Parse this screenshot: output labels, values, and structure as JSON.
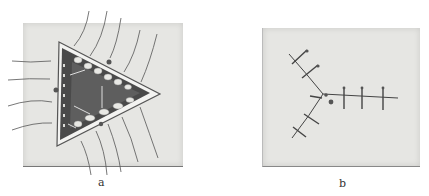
{
  "figure": {
    "panels": [
      {
        "id": "a",
        "label": "a",
        "description": "Triangular wound with undermined edges and placed suture threads"
      },
      {
        "id": "b",
        "label": "b",
        "description": "Closed wound in Y-shaped suture line with interrupted stitches"
      }
    ]
  },
  "colors": {
    "background": "#ffffff",
    "paper": "#e6e6e3",
    "wound_dark": "#3a3a3a",
    "thread": "#555555"
  }
}
